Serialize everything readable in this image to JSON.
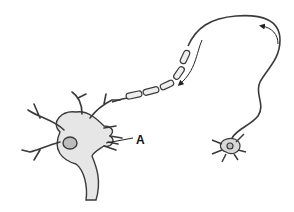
{
  "diagram": {
    "type": "neuron-illustration",
    "labels": [
      {
        "id": "A",
        "text": "A",
        "points_to": "dendrites of large neuron"
      }
    ],
    "components": [
      "large-neuron-cell-body",
      "nucleus",
      "dendrites",
      "myelinated-axon",
      "axon-fiber",
      "small-neuron",
      "direction-arrow-1",
      "direction-arrow-2"
    ],
    "colors": {
      "outline": "#3a3a3a",
      "fill": "#e6e6e6",
      "nucleus": "#bdbdbd",
      "background": "#ffffff"
    }
  }
}
